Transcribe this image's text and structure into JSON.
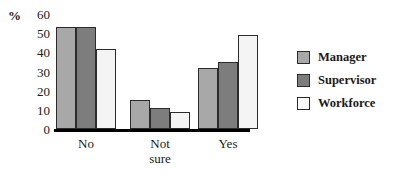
{
  "chart_data": {
    "type": "bar",
    "title": "",
    "xlabel": "",
    "ylabel": "%",
    "ylim": [
      0,
      60
    ],
    "yticks": [
      60,
      50,
      40,
      30,
      20,
      10,
      0
    ],
    "grid": false,
    "legend_position": "right",
    "categories": [
      "No",
      "Not sure",
      "Yes"
    ],
    "category_lines": [
      [
        "No"
      ],
      [
        "Not",
        "sure"
      ],
      [
        "Yes"
      ]
    ],
    "series": [
      {
        "name": "Manager",
        "color": "#a8a8a8",
        "values": [
          53,
          15,
          32
        ]
      },
      {
        "name": "Supervisor",
        "color": "#7d7d7d",
        "values": [
          53,
          11,
          35
        ]
      },
      {
        "name": "Workforce",
        "color": "#f4f4f4",
        "values": [
          42,
          9,
          49
        ]
      }
    ]
  },
  "axis": {
    "unit_label": "%"
  },
  "legend": {
    "entries": [
      {
        "label": "Manager"
      },
      {
        "label": "Supervisor"
      },
      {
        "label": "Workforce"
      }
    ]
  }
}
